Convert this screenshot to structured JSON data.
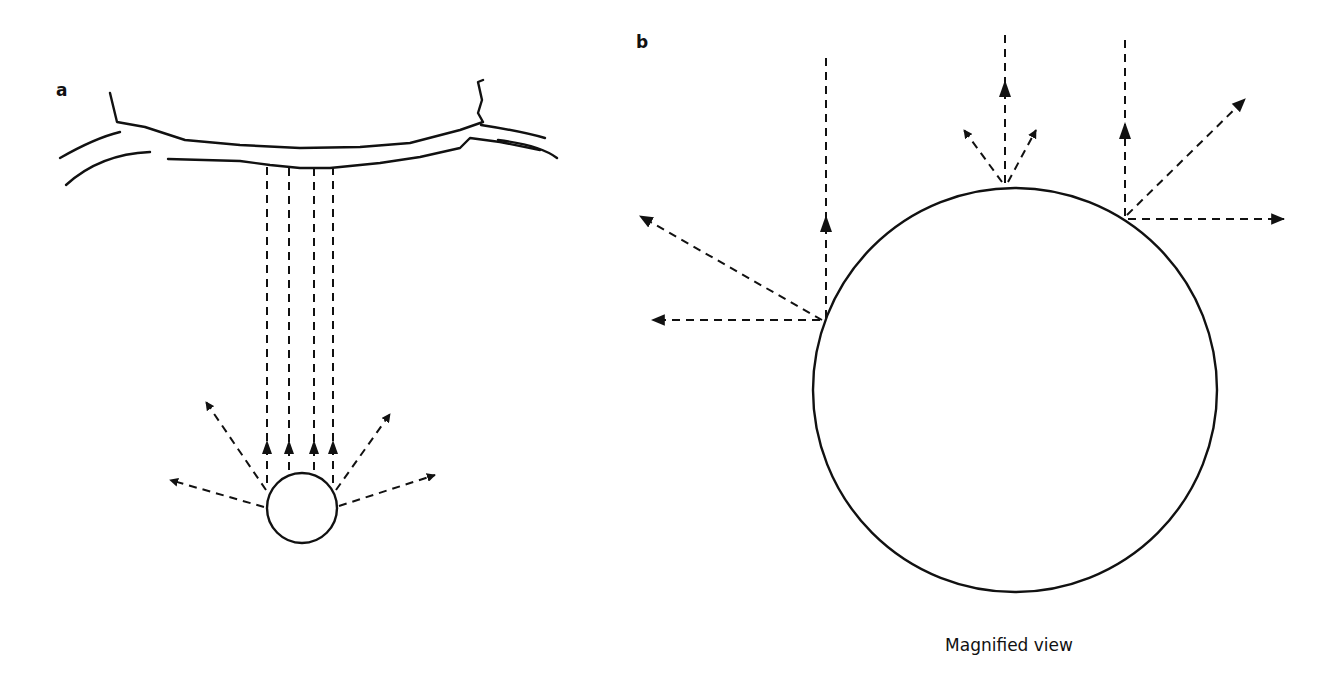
{
  "figure": {
    "panels": [
      {
        "id": "a",
        "label": "a",
        "description": "Small particle below a vessel-like surface; four vertical rays upward to the surface plus four scattered rays to the sides"
      },
      {
        "id": "b",
        "label": "b",
        "description": "Magnified view of particle showing rays scattered at surface points",
        "caption": "Magnified view"
      }
    ],
    "colors": {
      "ink": "#111111",
      "background": "#ffffff"
    }
  }
}
